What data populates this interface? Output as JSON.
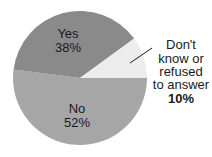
{
  "chart_data": {
    "type": "pie",
    "title": "",
    "categories": [
      "Yes",
      "No",
      "Don't know or refused to answer"
    ],
    "values": [
      38,
      52,
      10
    ],
    "unit": "%",
    "labels": [
      {
        "name": "Yes",
        "value": "38%"
      },
      {
        "name": "No",
        "value": "52%"
      },
      {
        "name_lines": [
          "Don't",
          "know or",
          "refused",
          "to answer"
        ],
        "value": "10%"
      }
    ],
    "colors": {
      "Yes": "#8a8a8a",
      "No": "#a6a6a6",
      "Dont_know": "#ececec"
    },
    "legend": "none"
  }
}
